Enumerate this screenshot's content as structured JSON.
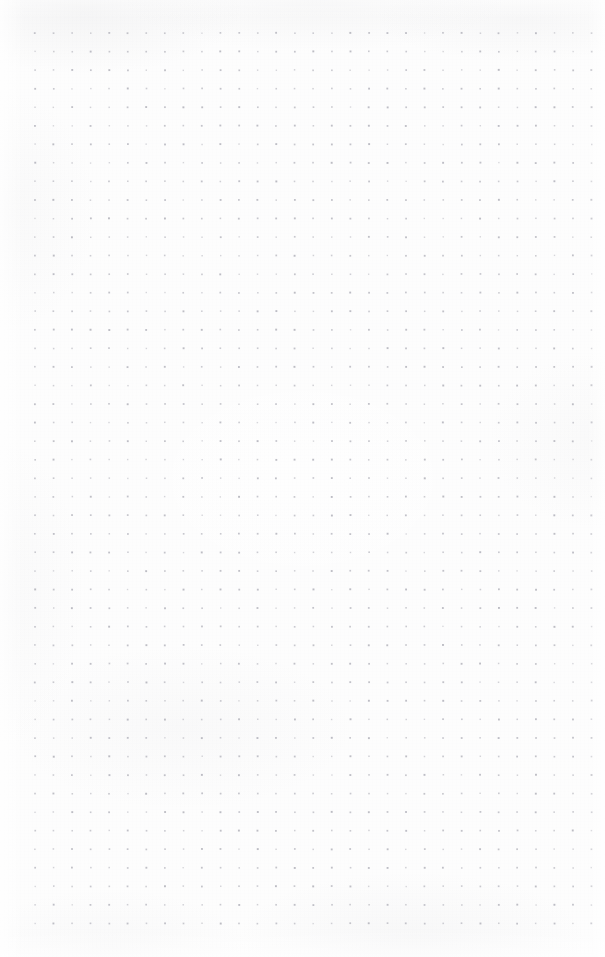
{
  "page": {
    "kind": "dot-grid-notebook-page",
    "width": 605,
    "height": 957,
    "background_color": "#fdfdfd",
    "is_blank": true,
    "visible_text": []
  },
  "grid": {
    "label": "dot grid",
    "dot_color": "#b8b8c0",
    "dot_size_px": 1.6,
    "spacing_px": 18.55,
    "columns": 31,
    "rows": 49,
    "origin_x": 35,
    "origin_y": 33,
    "margin_left_px": 35,
    "margin_top_px": 33,
    "margin_right_px": 16,
    "margin_bottom_px": 33
  },
  "texture": {
    "paper_tint": "#fdfdfd",
    "smudge_color": "#96969e",
    "grain_opacity": 0.3
  }
}
